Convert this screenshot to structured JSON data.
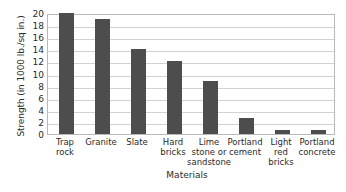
{
  "chart_data": {
    "type": "bar",
    "title": "",
    "xlabel": "Materials",
    "ylabel": "Strength (in 1000 lb./sq in.)",
    "categories": [
      "Trap rock",
      "Granite",
      "Slate",
      "Hard bricks",
      "Lime stone or sandstone",
      "Portland cement",
      "Light red bricks",
      "Portland concrete"
    ],
    "category_lines": [
      [
        "Trap",
        "rock"
      ],
      [
        "Granite"
      ],
      [
        "Slate"
      ],
      [
        "Hard",
        "bricks"
      ],
      [
        "Lime",
        "stone or",
        "sandstone"
      ],
      [
        "Portland",
        "cement"
      ],
      [
        "Light",
        "red",
        "bricks"
      ],
      [
        "Portland",
        "concrete"
      ]
    ],
    "values": [
      20,
      19,
      14,
      12,
      8.8,
      2.6,
      0.7,
      0.6
    ],
    "ylim": [
      0,
      20
    ],
    "yticks": [
      0,
      2,
      4,
      6,
      8,
      10,
      12,
      14,
      16,
      18,
      20
    ],
    "ytick_labels": [
      "0",
      "2",
      "4",
      "6",
      "8",
      "10",
      "12",
      "14",
      "16",
      "18",
      "20"
    ],
    "grid": true,
    "legend": false,
    "bar_color": "#4d4d4d",
    "gridline_color": "#d2d2d2",
    "frame_color": "#b9b9b9",
    "background_color": "#ffffff"
  }
}
